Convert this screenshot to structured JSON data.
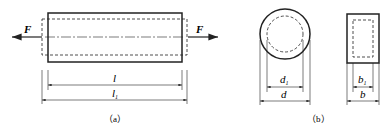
{
  "figure_a": {
    "force_left": "F",
    "force_right": "F",
    "dim_inner": "l",
    "dim_outer": "l",
    "dim_outer_sub": "1",
    "caption": "（a）"
  },
  "figure_b": {
    "dim_d1": "d",
    "dim_d1_sub": "1",
    "dim_d": "d",
    "dim_b1": "b",
    "dim_b1_sub": "1",
    "dim_b": "b",
    "caption": "（b）"
  }
}
